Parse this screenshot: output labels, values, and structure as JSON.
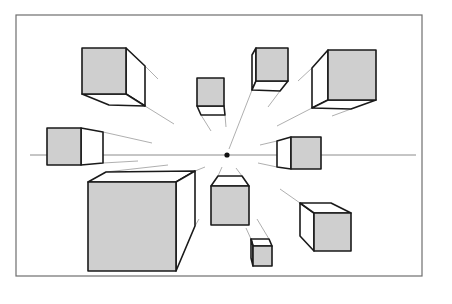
{
  "diagram": {
    "title": "",
    "colors": {
      "front_face": "#cfcfcf",
      "side_face": "#ffffff",
      "outline": "#1a1a1a",
      "guide_lines": "#9a9a9a",
      "frame": "#6e6e6e"
    },
    "frame": {
      "x": 16,
      "y": 15,
      "width": 406,
      "height": 261
    },
    "horizon": {
      "x1": 30,
      "x2": 416,
      "y": 155
    },
    "vanishing_point": {
      "x": 227,
      "y": 155,
      "r": 2.6
    },
    "cubes": [
      {
        "id": "cube-top-left-large",
        "front": [
          [
            82,
            48
          ],
          [
            126,
            48
          ],
          [
            126,
            94
          ],
          [
            82,
            94
          ]
        ],
        "sides": [
          [
            [
              126,
              48
            ],
            [
              145,
              66
            ],
            [
              145,
              106
            ],
            [
              126,
              94
            ]
          ],
          [
            [
              82,
              94
            ],
            [
              126,
              94
            ],
            [
              145,
              106
            ],
            [
              109,
              105
            ]
          ]
        ],
        "rays": [
          [
            145,
            66,
            158,
            79
          ],
          [
            145,
            106,
            174,
            124
          ]
        ]
      },
      {
        "id": "cube-top-center-small",
        "front": [
          [
            197,
            78
          ],
          [
            224,
            78
          ],
          [
            224,
            106
          ],
          [
            197,
            106
          ]
        ],
        "sides": [
          [
            [
              197,
              106
            ],
            [
              224,
              106
            ],
            [
              225,
              115
            ],
            [
              201,
              115
            ]
          ]
        ],
        "rays": [
          [
            201,
            115,
            211,
            131
          ],
          [
            225,
            115,
            226,
            127
          ]
        ]
      },
      {
        "id": "cube-top-center",
        "front": [
          [
            256,
            48
          ],
          [
            288,
            48
          ],
          [
            288,
            81
          ],
          [
            256,
            81
          ]
        ],
        "sides": [
          [
            [
              256,
              48
            ],
            [
              252,
              55
            ],
            [
              252,
              90
            ],
            [
              256,
              81
            ]
          ],
          [
            [
              256,
              81
            ],
            [
              288,
              81
            ],
            [
              280,
              91
            ],
            [
              252,
              90
            ]
          ]
        ],
        "rays": [
          [
            252,
            90,
            229,
            149
          ],
          [
            280,
            91,
            268,
            107
          ]
        ]
      },
      {
        "id": "cube-top-right-large",
        "front": [
          [
            328,
            50
          ],
          [
            376,
            50
          ],
          [
            376,
            100
          ],
          [
            328,
            100
          ]
        ],
        "sides": [
          [
            [
              328,
              50
            ],
            [
              312,
              68
            ],
            [
              312,
              108
            ],
            [
              328,
              100
            ]
          ],
          [
            [
              328,
              100
            ],
            [
              376,
              100
            ],
            [
              351,
              109
            ],
            [
              312,
              108
            ]
          ]
        ],
        "rays": [
          [
            312,
            68,
            298,
            81
          ],
          [
            312,
            108,
            277,
            126
          ],
          [
            351,
            109,
            332,
            116
          ]
        ]
      },
      {
        "id": "cube-left-mid",
        "front": [
          [
            47,
            128
          ],
          [
            81,
            128
          ],
          [
            81,
            165
          ],
          [
            47,
            165
          ]
        ],
        "sides": [
          [
            [
              81,
              128
            ],
            [
              103,
              132
            ],
            [
              103,
              163
            ],
            [
              81,
              165
            ]
          ]
        ],
        "rays": [
          [
            103,
            132,
            152,
            143
          ],
          [
            103,
            163,
            138,
            161
          ]
        ]
      },
      {
        "id": "cube-right-mid",
        "front": [
          [
            291,
            137
          ],
          [
            321,
            137
          ],
          [
            321,
            169
          ],
          [
            291,
            169
          ]
        ],
        "sides": [
          [
            [
              291,
              137
            ],
            [
              277,
              141
            ],
            [
              277,
              167
            ],
            [
              291,
              169
            ]
          ]
        ],
        "rays": [
          [
            277,
            141,
            260,
            145
          ],
          [
            277,
            167,
            258,
            163
          ]
        ]
      },
      {
        "id": "cube-bottom-left-large",
        "front": [
          [
            88,
            182
          ],
          [
            176,
            182
          ],
          [
            176,
            271
          ],
          [
            88,
            271
          ]
        ],
        "sides": [
          [
            [
              88,
              182
            ],
            [
              106,
              172
            ],
            [
              195,
              171
            ],
            [
              176,
              182
            ]
          ],
          [
            [
              176,
              182
            ],
            [
              195,
              171
            ],
            [
              195,
              226
            ],
            [
              176,
              271
            ]
          ]
        ],
        "rays": [
          [
            106,
            172,
            168,
            165
          ],
          [
            195,
            171,
            205,
            167
          ],
          [
            195,
            226,
            199,
            219
          ]
        ]
      },
      {
        "id": "cube-center-bottom",
        "front": [
          [
            211,
            186
          ],
          [
            249,
            186
          ],
          [
            249,
            225
          ],
          [
            211,
            225
          ]
        ],
        "sides": [
          [
            [
              211,
              186
            ],
            [
              218,
              176
            ],
            [
              242,
              176
            ],
            [
              249,
              186
            ]
          ]
        ],
        "rays": [
          [
            218,
            176,
            222,
            167
          ],
          [
            242,
            176,
            236,
            168
          ]
        ]
      },
      {
        "id": "cube-bottom-small",
        "front": [
          [
            253,
            246
          ],
          [
            272,
            246
          ],
          [
            272,
            266
          ],
          [
            253,
            266
          ]
        ],
        "sides": [
          [
            [
              253,
              246
            ],
            [
              251,
              239
            ],
            [
              269,
              239
            ],
            [
              272,
              246
            ]
          ],
          [
            [
              251,
              239
            ],
            [
              253,
              246
            ],
            [
              253,
              266
            ],
            [
              251,
              258
            ]
          ]
        ],
        "rays": [
          [
            251,
            239,
            246,
            228
          ],
          [
            269,
            239,
            257,
            219
          ]
        ]
      },
      {
        "id": "cube-bottom-right",
        "front": [
          [
            314,
            213
          ],
          [
            351,
            213
          ],
          [
            351,
            251
          ],
          [
            314,
            251
          ]
        ],
        "sides": [
          [
            [
              314,
              213
            ],
            [
              300,
              203
            ],
            [
              300,
              236
            ],
            [
              314,
              251
            ]
          ],
          [
            [
              300,
              203
            ],
            [
              331,
              203
            ],
            [
              351,
              213
            ],
            [
              314,
              213
            ]
          ]
        ],
        "rays": [
          [
            300,
            203,
            280,
            189
          ]
        ]
      }
    ]
  }
}
